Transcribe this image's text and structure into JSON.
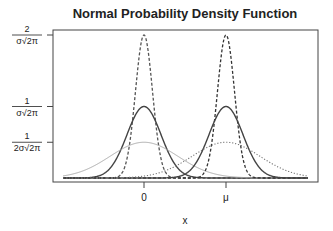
{
  "chart_data": {
    "type": "line",
    "title": "Normal Probability Density Function",
    "xlabel": "x",
    "ylabel": "",
    "x_ticks": [
      {
        "label": "0",
        "value": 0
      },
      {
        "label": "μ",
        "value": "mu"
      }
    ],
    "y_ticks": [
      {
        "numerator": "2",
        "denominator": "σ√2π",
        "value": 2
      },
      {
        "numerator": "1",
        "denominator": "σ√2π",
        "value": 1
      },
      {
        "numerator": "1",
        "denominator": "2σ√2π",
        "value": 0.5
      }
    ],
    "grid": false,
    "legend": null,
    "series": [
      {
        "name": "N(0, σ/2)",
        "center": 0,
        "sd_factor": 0.5,
        "peak": 2,
        "style": "dashed",
        "color": "#555555"
      },
      {
        "name": "N(0, σ)",
        "center": 0,
        "sd_factor": 1,
        "peak": 1,
        "style": "solid",
        "color": "#444444"
      },
      {
        "name": "N(0, 2σ)",
        "center": 0,
        "sd_factor": 2,
        "peak": 0.5,
        "style": "solid-light",
        "color": "#aaaaaa"
      },
      {
        "name": "N(μ, σ/2)",
        "center": "mu",
        "sd_factor": 0.5,
        "peak": 2,
        "style": "dashed",
        "color": "#333333"
      },
      {
        "name": "N(μ, σ)",
        "center": "mu",
        "sd_factor": 1,
        "peak": 1,
        "style": "solid",
        "color": "#444444"
      },
      {
        "name": "N(μ, 2σ)",
        "center": "mu",
        "sd_factor": 2,
        "peak": 0.5,
        "style": "dotted",
        "color": "#777777"
      }
    ],
    "layout": {
      "frame": {
        "x0": 53,
        "y0": 30,
        "x1": 318,
        "y1": 182
      },
      "baseline_y": 178,
      "px_per_unit_y": 71.5,
      "curve_x_range": [
        63,
        308
      ],
      "center_px": {
        "0": 144,
        "mu": 226
      },
      "sigma_px": 17
    }
  }
}
